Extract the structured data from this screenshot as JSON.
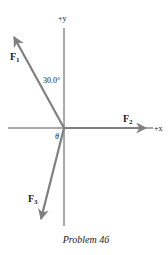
{
  "diagram": {
    "caption": "Problem 46",
    "axes": {
      "y_label": "+y",
      "x_label": "+x"
    },
    "forces": [
      {
        "name": "F",
        "subscript": "1",
        "direction": "up-left",
        "angle_label": "30.0°",
        "angle_reference": "+y axis"
      },
      {
        "name": "F",
        "subscript": "2",
        "direction": "+x"
      },
      {
        "name": "F",
        "subscript": "3",
        "direction": "down-left",
        "angle_label": "θ",
        "angle_reference": "-x axis"
      }
    ],
    "colors": {
      "axis": "#555555",
      "vector": "#808080",
      "text": "#1a1a1a"
    }
  }
}
